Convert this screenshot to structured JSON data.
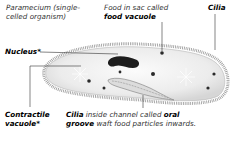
{
  "title": {
    "line1": "Paramecium (single-",
    "line2": "celled organism)"
  },
  "labels": {
    "food_vacuole": {
      "line1": "Food in sac called",
      "line2": "food vacuole"
    },
    "cilia_top": "Cilia",
    "nucleus": "Nucleus*",
    "contractile_vacuole": {
      "line1": "Contractile",
      "line2": "vacuole*"
    },
    "oral_groove": {
      "bold1": "Cilia",
      "text1": " inside channel called ",
      "bold2": "oral",
      "bold3": "groove",
      "text2": " waft food particles inwards."
    }
  },
  "colors": {
    "cell_fill": "#ececec",
    "cilia": "#8a8a8a",
    "nucleus": "#1a1a1a",
    "leader_line": "#333333"
  }
}
